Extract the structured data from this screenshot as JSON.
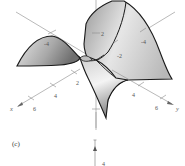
{
  "figure": {
    "panel_label": "(c)",
    "axes": {
      "x": {
        "label": "x",
        "ticks": [
          "2",
          "4",
          "6"
        ]
      },
      "y": {
        "label": "y",
        "ticks": [
          "4",
          "6"
        ]
      },
      "z": {
        "ticks": [
          "2"
        ]
      },
      "negative_ticks": [
        "-4",
        "-4",
        "-2"
      ]
    },
    "next_panel_tick": "4",
    "colors": {
      "outline": "#1a1a1a",
      "axis": "#8a8a8a",
      "surface_light": "#f2f2f2",
      "surface_dark": "#8c8c8c"
    }
  }
}
